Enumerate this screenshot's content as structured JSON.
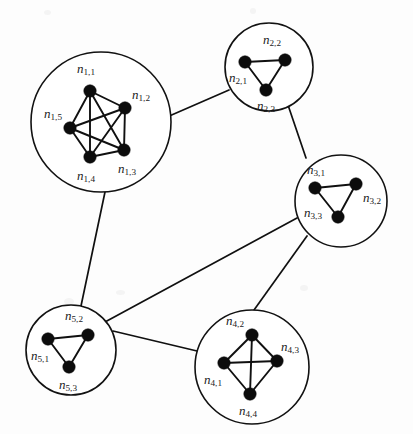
{
  "figure": {
    "background_color": "#fdfdfd",
    "node_color": "#0c0c0c",
    "edge_color": "#101010",
    "circle_stroke_color": "#121212",
    "label_color": "#1a1a1a",
    "width": 413,
    "height": 434
  },
  "chart_data": {
    "type": "diagram",
    "graph_kind": "clustered-graph",
    "cluster_count": 5,
    "node_count": 18,
    "clusters": [
      {
        "id": "c1",
        "name": "cluster-1",
        "center": [
          101,
          122
        ],
        "radius": 70,
        "clique": "K5",
        "nodes": [
          {
            "id": "n1_1",
            "base": "n",
            "sub": "1,1",
            "x": 90,
            "y": 91,
            "label_x": 86,
            "label_y": 70,
            "anchor": "middle"
          },
          {
            "id": "n1_2",
            "base": "n",
            "sub": "1,2",
            "x": 125,
            "y": 108,
            "label_x": 141,
            "label_y": 96,
            "anchor": "middle"
          },
          {
            "id": "n1_5",
            "base": "n",
            "sub": "1,5",
            "x": 70,
            "y": 128,
            "label_x": 53,
            "label_y": 115,
            "anchor": "middle"
          },
          {
            "id": "n1_3",
            "base": "n",
            "sub": "1,3",
            "x": 124,
            "y": 150,
            "label_x": 127,
            "label_y": 170,
            "anchor": "middle"
          },
          {
            "id": "n1_4",
            "base": "n",
            "sub": "1,4",
            "x": 90,
            "y": 157,
            "label_x": 86,
            "label_y": 177,
            "anchor": "middle"
          }
        ],
        "edges": [
          [
            "n1_1",
            "n1_2"
          ],
          [
            "n1_1",
            "n1_3"
          ],
          [
            "n1_1",
            "n1_4"
          ],
          [
            "n1_1",
            "n1_5"
          ],
          [
            "n1_2",
            "n1_3"
          ],
          [
            "n1_2",
            "n1_4"
          ],
          [
            "n1_2",
            "n1_5"
          ],
          [
            "n1_3",
            "n1_4"
          ],
          [
            "n1_3",
            "n1_5"
          ],
          [
            "n1_4",
            "n1_5"
          ]
        ]
      },
      {
        "id": "c2",
        "name": "cluster-2",
        "center": [
          269,
          67
        ],
        "radius": 44,
        "clique": "K3",
        "nodes": [
          {
            "id": "n2_1",
            "base": "n",
            "sub": "2,1",
            "x": 245,
            "y": 62,
            "label_x": 238,
            "label_y": 79,
            "anchor": "middle"
          },
          {
            "id": "n2_2",
            "base": "n",
            "sub": "2,2",
            "x": 285,
            "y": 60,
            "label_x": 272,
            "label_y": 41,
            "anchor": "middle"
          },
          {
            "id": "n2_3",
            "base": "n",
            "sub": "2,3",
            "x": 266,
            "y": 90,
            "label_x": 266,
            "label_y": 107,
            "anchor": "middle"
          }
        ],
        "edges": [
          [
            "n2_1",
            "n2_2"
          ],
          [
            "n2_2",
            "n2_3"
          ],
          [
            "n2_1",
            "n2_3"
          ]
        ]
      },
      {
        "id": "c3",
        "name": "cluster-3",
        "center": [
          341,
          201
        ],
        "radius": 46,
        "clique": "K3",
        "nodes": [
          {
            "id": "n3_1",
            "base": "n",
            "sub": "3,1",
            "x": 315,
            "y": 188,
            "label_x": 316,
            "label_y": 171,
            "anchor": "middle"
          },
          {
            "id": "n3_2",
            "base": "n",
            "sub": "3,2",
            "x": 356,
            "y": 184,
            "label_x": 372,
            "label_y": 199,
            "anchor": "middle"
          },
          {
            "id": "n3_3",
            "base": "n",
            "sub": "3,3",
            "x": 338,
            "y": 217,
            "label_x": 313,
            "label_y": 214,
            "anchor": "middle"
          }
        ],
        "edges": [
          [
            "n3_1",
            "n3_2"
          ],
          [
            "n3_2",
            "n3_3"
          ],
          [
            "n3_1",
            "n3_3"
          ]
        ]
      },
      {
        "id": "c4",
        "name": "cluster-4",
        "center": [
          252,
          367
        ],
        "radius": 57,
        "clique": "K4",
        "nodes": [
          {
            "id": "n4_1",
            "base": "n",
            "sub": "4,1",
            "x": 224,
            "y": 363,
            "label_x": 213,
            "label_y": 381,
            "anchor": "middle"
          },
          {
            "id": "n4_2",
            "base": "n",
            "sub": "4,2",
            "x": 252,
            "y": 335,
            "label_x": 235,
            "label_y": 322,
            "anchor": "middle"
          },
          {
            "id": "n4_3",
            "base": "n",
            "sub": "4,3",
            "x": 277,
            "y": 361,
            "label_x": 290,
            "label_y": 348,
            "anchor": "middle"
          },
          {
            "id": "n4_4",
            "base": "n",
            "sub": "4,4",
            "x": 250,
            "y": 394,
            "label_x": 248,
            "label_y": 412,
            "anchor": "middle"
          }
        ],
        "edges": [
          [
            "n4_1",
            "n4_2"
          ],
          [
            "n4_1",
            "n4_3"
          ],
          [
            "n4_1",
            "n4_4"
          ],
          [
            "n4_2",
            "n4_3"
          ],
          [
            "n4_2",
            "n4_4"
          ],
          [
            "n4_3",
            "n4_4"
          ]
        ]
      },
      {
        "id": "c5",
        "name": "cluster-5",
        "center": [
          71,
          350
        ],
        "radius": 45,
        "clique": "K3",
        "nodes": [
          {
            "id": "n5_1",
            "base": "n",
            "sub": "5,1",
            "x": 48,
            "y": 339,
            "label_x": 40,
            "label_y": 357,
            "anchor": "middle"
          },
          {
            "id": "n5_2",
            "base": "n",
            "sub": "5,2",
            "x": 88,
            "y": 335,
            "label_x": 74,
            "label_y": 317,
            "anchor": "middle"
          },
          {
            "id": "n5_3",
            "base": "n",
            "sub": "5,3",
            "x": 69,
            "y": 367,
            "label_x": 68,
            "label_y": 386,
            "anchor": "middle"
          }
        ],
        "edges": [
          [
            "n5_1",
            "n5_2"
          ],
          [
            "n5_2",
            "n5_3"
          ],
          [
            "n5_1",
            "n5_3"
          ]
        ]
      }
    ],
    "inter_cluster_edges": [
      {
        "id": "e_c1_c2",
        "from": "c1",
        "to": "c2",
        "x1": 167,
        "y1": 117,
        "x2": 229,
        "y2": 90
      },
      {
        "id": "e_c2_c3",
        "from": "c2",
        "to": "c3",
        "x1": 288,
        "y1": 105,
        "x2": 306,
        "y2": 158
      },
      {
        "id": "e_c1_c5",
        "from": "c1",
        "to": "c5",
        "x1": 105,
        "y1": 192,
        "x2": 81,
        "y2": 306
      },
      {
        "id": "e_c3_c5",
        "from": "c3",
        "to": "c5",
        "x1": 297,
        "y1": 218,
        "x2": 105,
        "y2": 322
      },
      {
        "id": "e_c3_c4",
        "from": "c3",
        "to": "c4",
        "x1": 307,
        "y1": 236,
        "x2": 254,
        "y2": 310
      },
      {
        "id": "e_c5_c4",
        "from": "c5",
        "to": "c4",
        "x1": 113,
        "y1": 331,
        "x2": 197,
        "y2": 351
      }
    ]
  }
}
